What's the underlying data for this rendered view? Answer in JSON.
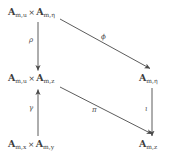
{
  "diagram": {
    "kind": "commutative-diagram",
    "background_color": "#ffffff",
    "ink_color": "#3d3d3d",
    "nodes": [
      {
        "id": "top-left",
        "blackboard": "A",
        "parts": [
          {
            "base": "A",
            "sub": "m,u"
          },
          {
            "base": "A",
            "sub": "m,η"
          }
        ],
        "operator": "×",
        "text": "𝔸m,u × 𝔸m,η"
      },
      {
        "id": "middle-left",
        "blackboard": "A",
        "parts": [
          {
            "base": "A",
            "sub": "m,u"
          },
          {
            "base": "A",
            "sub": "m,z"
          }
        ],
        "operator": "×",
        "text": "𝔸m,u × 𝔸m,z"
      },
      {
        "id": "bottom-left",
        "blackboard": "A",
        "parts": [
          {
            "base": "A",
            "sub": "m,x"
          },
          {
            "base": "A",
            "sub": "m,y"
          }
        ],
        "operator": "×",
        "text": "𝔸m,x × 𝔸m,y"
      },
      {
        "id": "middle-right",
        "blackboard": "A",
        "parts": [
          {
            "base": "A",
            "sub": "m,η"
          }
        ],
        "operator": "",
        "text": "𝔸m,η"
      },
      {
        "id": "bottom-right",
        "blackboard": "A",
        "parts": [
          {
            "base": "A",
            "sub": "m,z"
          }
        ],
        "operator": "",
        "text": "𝔸m,z"
      }
    ],
    "arrows": [
      {
        "id": "rho",
        "label": "ρ",
        "from": "top-left",
        "to": "middle-left",
        "direction": "down",
        "style": "solid"
      },
      {
        "id": "phi",
        "label": "ϕ",
        "from": "top-left",
        "to": "middle-right",
        "direction": "down-right",
        "style": "solid"
      },
      {
        "id": "gamma",
        "label": "γ",
        "from": "bottom-left",
        "to": "middle-left",
        "direction": "up",
        "style": "solid"
      },
      {
        "id": "pi",
        "label": "π",
        "from": "middle-left",
        "to": "bottom-right",
        "direction": "down-right",
        "style": "solid"
      },
      {
        "id": "iota",
        "label": "ι",
        "from": "middle-right",
        "to": "bottom-right",
        "direction": "down",
        "style": "solid"
      }
    ]
  }
}
